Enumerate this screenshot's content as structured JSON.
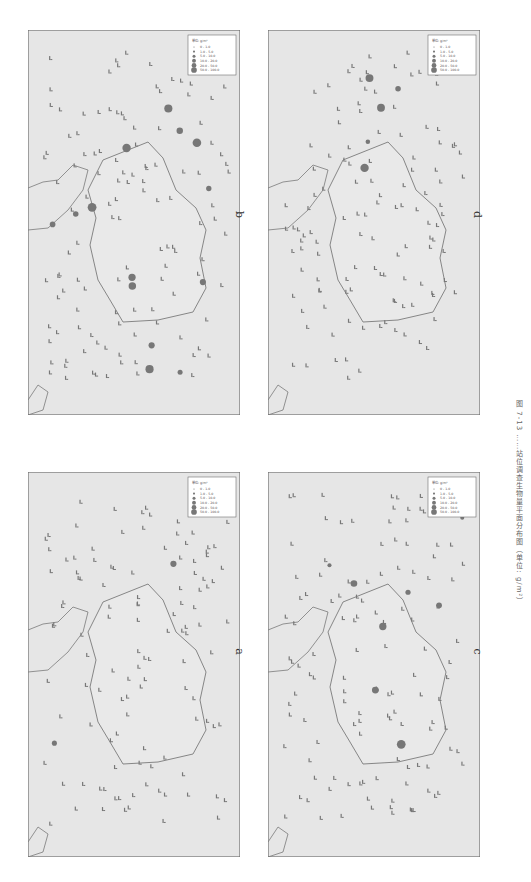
{
  "figure": {
    "caption": "图 7-13 ……站位调查生物量平面分布图（单位: g/m²）",
    "panels": [
      {
        "id": "b",
        "label": "b"
      },
      {
        "id": "d",
        "label": "d"
      },
      {
        "id": "a",
        "label": "a"
      },
      {
        "id": "c",
        "label": "c"
      }
    ],
    "legend": {
      "title": "单位: g/m²",
      "classes": [
        "0 - 1.0",
        "1.0 - 5.0",
        "5.0 - 10.0",
        "10.0 - 20.0",
        "20.0 - 50.0",
        "50.0 - 100.0"
      ]
    },
    "colors": {
      "map_background": "#e6e6e6",
      "frame": "#6e6e6e",
      "coastline": "#7a7a7a",
      "station_marker": "#777777"
    }
  }
}
